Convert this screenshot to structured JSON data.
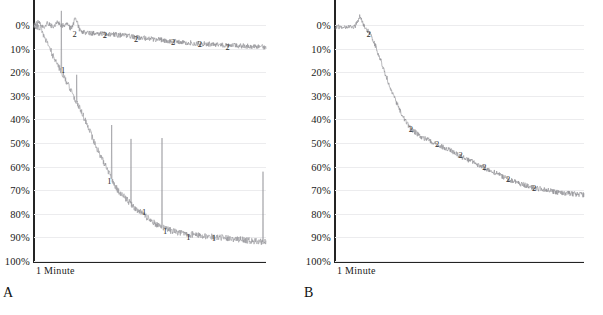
{
  "figure": {
    "width": 603,
    "height": 315,
    "background": "#ffffff",
    "trace_color": "#8d8d92",
    "axis_color": "#242424",
    "gridline_color": "#ececee"
  },
  "panels": [
    {
      "letter": "A",
      "xaxis_label": "1 Minute",
      "yticks": [
        "0%",
        "10%",
        "20%",
        "30%",
        "40%",
        "50%",
        "60%",
        "70%",
        "80%",
        "90%",
        "100%"
      ],
      "marker_labels_upper": [
        "2",
        "2",
        "2",
        "2",
        "2",
        "2"
      ],
      "marker_labels_lower": [
        "1",
        "1",
        "1",
        "1",
        "1",
        "1"
      ]
    },
    {
      "letter": "B",
      "xaxis_label": "1 Minute",
      "yticks": [
        "0%",
        "10%",
        "20%",
        "30%",
        "40%",
        "50%",
        "60%",
        "70%",
        "80%",
        "90%",
        "100%"
      ],
      "marker_labels_upper": [
        "2",
        "2",
        "2",
        "2",
        "2",
        "2",
        "2"
      ],
      "marker_labels_lower": []
    }
  ],
  "chart_data": {
    "type": "line",
    "title": "",
    "xlabel": "1 Minute",
    "ylabel": "",
    "ylim": [
      0,
      100
    ],
    "y_inverted": true,
    "y_tick_labels": [
      "0%",
      "10%",
      "20%",
      "30%",
      "40%",
      "50%",
      "60%",
      "70%",
      "80%",
      "90%",
      "100%"
    ],
    "y_tick_values": [
      0,
      10,
      20,
      30,
      40,
      50,
      60,
      70,
      80,
      90,
      100
    ],
    "grid": true,
    "legend": "none",
    "panels": [
      {
        "panel": "A",
        "xlabel": "1 Minute",
        "series": [
          {
            "name": "2",
            "label_markers": [
              "2",
              "2",
              "2",
              "2",
              "2",
              "2"
            ],
            "marker_x": [
              0.175,
              0.305,
              0.44,
              0.6,
              0.715,
              0.835
            ],
            "marker_y": [
              3.5,
              4.0,
              5.5,
              7.0,
              8.0,
              9.0
            ],
            "x": [
              0.0,
              0.02,
              0.04,
              0.06,
              0.08,
              0.1,
              0.12,
              0.14,
              0.16,
              0.18,
              0.2,
              0.24,
              0.28,
              0.32,
              0.36,
              0.4,
              0.44,
              0.48,
              0.52,
              0.56,
              0.6,
              0.64,
              0.68,
              0.72,
              0.76,
              0.8,
              0.84,
              0.88,
              0.92,
              0.96,
              1.0
            ],
            "y": [
              0.5,
              -1.5,
              1.0,
              -1.0,
              0.8,
              -1.2,
              0.5,
              -0.5,
              1.5,
              -3.0,
              3.0,
              3.4,
              3.6,
              3.8,
              4.2,
              4.6,
              5.2,
              5.6,
              6.0,
              6.5,
              7.0,
              7.3,
              7.6,
              7.9,
              8.1,
              8.4,
              8.6,
              8.8,
              9.0,
              9.2,
              9.4
            ]
          },
          {
            "name": "1",
            "label_markers": [
              "1",
              "1",
              "1",
              "1",
              "1",
              "1"
            ],
            "marker_x": [
              0.125,
              0.325,
              0.475,
              0.565,
              0.665,
              0.775
            ],
            "marker_y": [
              19.0,
              66.0,
              79.0,
              87.0,
              89.5,
              90.0
            ],
            "x": [
              0.0,
              0.03,
              0.06,
              0.09,
              0.12,
              0.15,
              0.18,
              0.21,
              0.24,
              0.27,
              0.3,
              0.33,
              0.36,
              0.4,
              0.44,
              0.48,
              0.52,
              0.56,
              0.6,
              0.65,
              0.7,
              0.75,
              0.8,
              0.85,
              0.9,
              0.95,
              1.0
            ],
            "y": [
              0.0,
              2.0,
              8.0,
              15.0,
              20.0,
              26.0,
              32.0,
              38.0,
              45.0,
              52.0,
              58.0,
              64.0,
              70.0,
              74.0,
              78.0,
              81.0,
              84.0,
              86.0,
              87.5,
              88.5,
              89.0,
              89.5,
              90.0,
              90.5,
              91.0,
              91.5,
              92.0
            ],
            "spikes": true,
            "spike_note": "frequent sharp upward (toward 0%) transient spikes reaching 20%-60% range"
          }
        ]
      },
      {
        "panel": "B",
        "xlabel": "1 Minute",
        "series": [
          {
            "name": "2",
            "label_markers": [
              "2",
              "2",
              "2",
              "2",
              "2",
              "2",
              "2"
            ],
            "marker_x": [
              0.135,
              0.305,
              0.41,
              0.505,
              0.6,
              0.695,
              0.8
            ],
            "marker_y": [
              3.5,
              44.0,
              50.0,
              55.0,
              60.0,
              65.0,
              69.0
            ],
            "x": [
              0.0,
              0.02,
              0.04,
              0.06,
              0.08,
              0.1,
              0.12,
              0.14,
              0.16,
              0.18,
              0.2,
              0.22,
              0.24,
              0.26,
              0.28,
              0.3,
              0.34,
              0.38,
              0.42,
              0.46,
              0.5,
              0.55,
              0.6,
              0.65,
              0.7,
              0.75,
              0.8,
              0.85,
              0.9,
              0.95,
              1.0
            ],
            "y": [
              1.0,
              0.8,
              1.0,
              0.6,
              0.9,
              -4.0,
              1.2,
              3.5,
              8.0,
              14.0,
              20.0,
              26.0,
              31.0,
              36.0,
              40.0,
              43.5,
              47.0,
              49.0,
              51.0,
              53.0,
              55.5,
              58.0,
              60.5,
              63.0,
              65.5,
              67.5,
              69.0,
              70.0,
              71.0,
              71.5,
              72.0
            ]
          }
        ]
      }
    ]
  }
}
